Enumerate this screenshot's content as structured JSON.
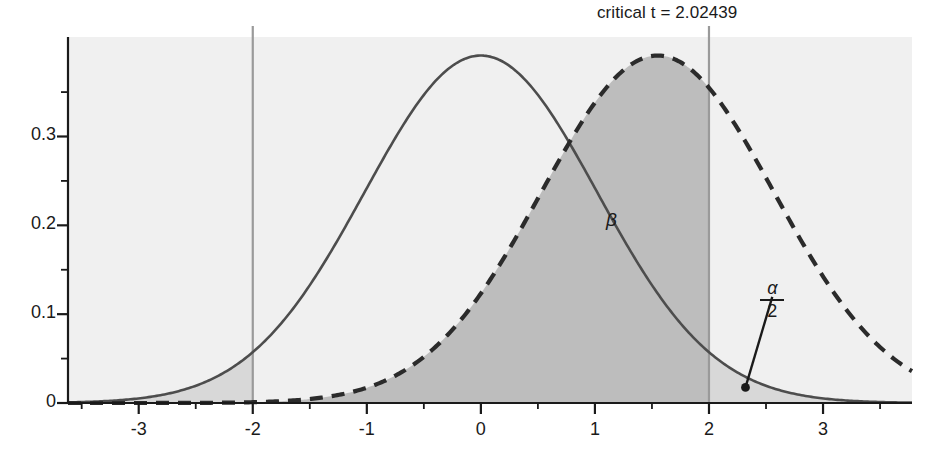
{
  "chart_data": {
    "type": "line",
    "title": "",
    "xlabel": "",
    "ylabel": "",
    "xlim": [
      -3.62,
      3.78
    ],
    "ylim": [
      0,
      0.412
    ],
    "grid": false,
    "legend": null,
    "background_color": "#f0f0f0",
    "axis_color": "#1a1a1a",
    "x_ticks_major": [
      -3,
      -2,
      -1,
      0,
      1,
      2,
      3
    ],
    "x_tick_labels": [
      "-3",
      "-2",
      "-1",
      "0",
      "1",
      "2",
      "3"
    ],
    "x_ticks_minor": [
      -3.5,
      -2.5,
      -1.5,
      -0.5,
      0.5,
      1.5,
      2.5,
      3.5
    ],
    "y_ticks_major": [
      0,
      0.1,
      0.2,
      0.3
    ],
    "y_tick_labels": [
      "0",
      "0.1",
      "0.2",
      "0.3"
    ],
    "y_ticks_minor": [
      0.05,
      0.15,
      0.25,
      0.35
    ],
    "series": [
      {
        "name": "null-distribution",
        "style": "solid",
        "color": "#4d4d4d",
        "line_width": 2.6,
        "mean": 0,
        "sd": 1.02,
        "peak_x": 0,
        "peak_y": 0.391
      },
      {
        "name": "alternative-distribution",
        "style": "dashed",
        "color": "#2b2b2b",
        "line_width": 4.2,
        "dash_pattern": "13,9",
        "mean": 1.55,
        "sd": 1.02,
        "peak_x": 1.55,
        "peak_y": 0.386
      }
    ],
    "vertical_lines": [
      {
        "name": "critical-line-negative",
        "x": -2.0,
        "color": "#9a9a9a",
        "width": 2.2
      },
      {
        "name": "critical-line-positive",
        "x": 2.0,
        "color": "#9a9a9a",
        "width": 2.2
      }
    ],
    "shaded_regions": [
      {
        "name": "beta-region",
        "label": "β",
        "fill": "#bdbdbd",
        "under_curve": "alternative-distribution",
        "x_from": -3.62,
        "x_to": 2.0
      },
      {
        "name": "alpha-half-right-tail",
        "label": "α/2",
        "fill": "#d8d8d8",
        "under_curve": "null-distribution",
        "x_from": 2.0,
        "x_to": 3.78
      },
      {
        "name": "alpha-half-left-tail",
        "label": "α/2",
        "fill": "#d8d8d8",
        "under_curve": "null-distribution",
        "x_from": -3.62,
        "x_to": -2.0
      }
    ],
    "annotations": [
      {
        "name": "critical-value-label",
        "text": "critical t = 2.02439",
        "x": 2.0,
        "y": 0.412,
        "anchor": "end-above"
      },
      {
        "name": "beta-annotation",
        "text": "β",
        "x": 1.15,
        "y": 0.205
      },
      {
        "name": "alpha-half-annotation",
        "numerator": "α",
        "denominator": "2",
        "text": "α/2",
        "x": 2.52,
        "y": 0.115,
        "leader_point_x": 2.32,
        "leader_point_y": 0.0175
      }
    ]
  },
  "labels": {
    "critical_text": "critical t = 2.02439",
    "beta_symbol": "β",
    "alpha_symbol": "α",
    "two": "2"
  }
}
